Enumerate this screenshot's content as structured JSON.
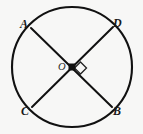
{
  "figure": {
    "kind": "geometry-diagram",
    "background_color": "#f7f7f6",
    "stroke_color": "#111111",
    "labels": {
      "A": "A",
      "B": "B",
      "C": "C",
      "D": "D",
      "O": "O"
    },
    "circle": {
      "center_x": 72,
      "center_y": 67,
      "radius": 60,
      "stroke_width": 2.1
    },
    "points": {
      "A": {
        "x": 31,
        "y": 28
      },
      "B": {
        "x": 112,
        "y": 107
      },
      "C": {
        "x": 32,
        "y": 107
      },
      "D": {
        "x": 113,
        "y": 27
      },
      "O": {
        "x": 72,
        "y": 67
      }
    },
    "segments": [
      {
        "name": "AB",
        "from": "A",
        "to": "B",
        "stroke_width": 2.0
      },
      {
        "name": "CD",
        "from": "C",
        "to": "D",
        "stroke_width": 2.0
      }
    ],
    "center_dot": {
      "shape": "filled-square",
      "size": 7,
      "fill": "#111111"
    },
    "right_angle_marker": {
      "shape": "rotated-square-outline",
      "center_x": 80.5,
      "center_y": 68,
      "half_diagonal": 6,
      "stroke_width": 1.3,
      "angle_degrees": 90
    }
  }
}
